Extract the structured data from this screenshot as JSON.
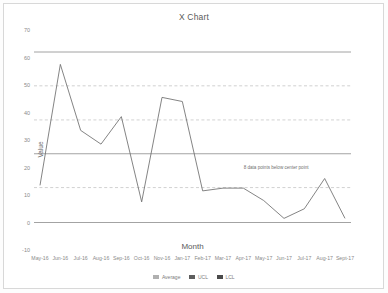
{
  "chart_data": {
    "type": "line",
    "title": "X Chart",
    "xlabel": "Month",
    "ylabel": "Value",
    "ylim": [
      -10,
      70
    ],
    "yticks": [
      70,
      60,
      50,
      40,
      30,
      20,
      10,
      0,
      -10
    ],
    "grid": false,
    "legend_position": "bottom",
    "categories": [
      "May-16",
      "Jun-16",
      "Jul-16",
      "Aug-16",
      "Sep-16",
      "Oct-16",
      "Nov-16",
      "Jan-17",
      "Feb-17",
      "Mar-17",
      "Apr-17",
      "May-17",
      "Jun-17",
      "Jul-17",
      "Aug-17",
      "Sept-17"
    ],
    "series": [
      {
        "name": "Average",
        "color": "#6e6e6e",
        "style": "solid",
        "values": [
          13.5,
          57.5,
          33.5,
          28.5,
          38.5,
          7.5,
          45.5,
          44.0,
          11.5,
          12.5,
          12.5,
          8.0,
          1.5,
          5.0,
          16.0,
          1.5
        ]
      }
    ],
    "control_lines": [
      {
        "name": "UCL",
        "value": 62.0,
        "style": "solid",
        "color": "#8c8c8c"
      },
      {
        "name": "+2 Sigma",
        "value": 49.7,
        "style": "dashed",
        "color": "#bdbdbd"
      },
      {
        "name": "+1 Sigma",
        "value": 37.3,
        "style": "dashed",
        "color": "#bdbdbd"
      },
      {
        "name": "Center",
        "value": 25.0,
        "style": "solid",
        "color": "#8c8c8c"
      },
      {
        "name": "-1 Sigma",
        "value": 12.7,
        "style": "dashed",
        "color": "#bdbdbd"
      },
      {
        "name": "LCL",
        "value": 0.0,
        "style": "solid",
        "color": "#8c8c8c"
      }
    ],
    "annotations": [
      {
        "text": "8 data points below center point",
        "x_category": "May-17",
        "y_value": 21.0
      }
    ]
  },
  "legend": {
    "items": [
      {
        "label": "Average",
        "color": "#b0b0b0"
      },
      {
        "label": "UCL",
        "color": "#5e5e5e"
      },
      {
        "label": "LCL",
        "color": "#4a4a4a"
      }
    ]
  }
}
